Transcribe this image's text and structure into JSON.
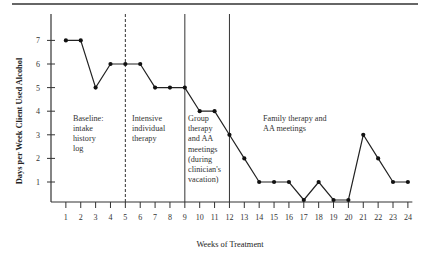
{
  "chart_data": {
    "type": "line",
    "title": "",
    "xlabel": "Weeks of Treatment",
    "ylabel": "Days per Week Client Used Alcohol",
    "x": [
      1,
      2,
      3,
      4,
      5,
      6,
      7,
      8,
      9,
      10,
      11,
      12,
      13,
      14,
      15,
      16,
      17,
      18,
      19,
      20,
      21,
      22,
      23,
      24
    ],
    "x_tick_labels": [
      "1",
      "2",
      "3",
      "4",
      "5",
      "6",
      "7",
      "8",
      "9",
      "10",
      "11",
      "12",
      "13",
      "14",
      "15",
      "16",
      "17",
      "18",
      "19",
      "20",
      "21",
      "22",
      "23",
      "24"
    ],
    "y_tick_labels": [
      "1",
      "2",
      "3",
      "4",
      "5",
      "6",
      "7"
    ],
    "y_ticks": [
      1,
      2,
      3,
      4,
      5,
      6,
      7
    ],
    "series": [
      {
        "name": "Days per week",
        "values": [
          7,
          7,
          5,
          6,
          6,
          6,
          5,
          5,
          5,
          4,
          4,
          3,
          2,
          1,
          1,
          1,
          0,
          1,
          0,
          0,
          3,
          2,
          1,
          1
        ]
      }
    ],
    "xlim": [
      0,
      24.3
    ],
    "ylim": [
      0,
      7.5
    ],
    "grid": false,
    "legend": "none",
    "phase_lines": [
      {
        "x": 5,
        "style": "dashed"
      },
      {
        "x": 9,
        "style": "solid"
      },
      {
        "x": 12,
        "style": "solid"
      }
    ],
    "annotations": [
      {
        "phase": "baseline",
        "lines": [
          "Baseline:",
          "intake",
          "history",
          "log"
        ]
      },
      {
        "phase": "intensive",
        "lines": [
          "Intensive",
          "individual",
          "therapy"
        ]
      },
      {
        "phase": "group",
        "lines": [
          "Group",
          "therapy",
          "and AA",
          "meetings",
          "(during",
          "clinician's",
          "vacation)"
        ]
      },
      {
        "phase": "family",
        "lines": [
          "Family therapy and",
          "AA meetings"
        ]
      }
    ]
  }
}
